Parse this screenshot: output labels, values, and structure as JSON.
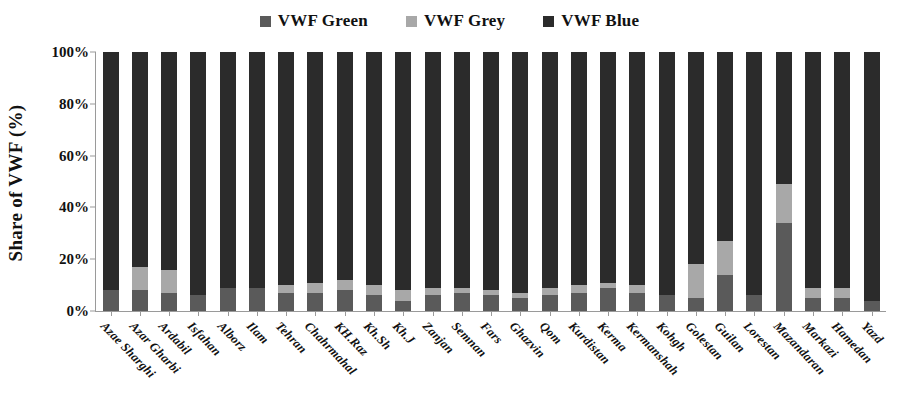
{
  "chart_data": {
    "type": "bar",
    "stacked": true,
    "title": "",
    "subtitle": "",
    "xlabel": "",
    "ylabel": "Share of VWF (%)",
    "ylim": [
      0,
      100
    ],
    "ytick_labels": [
      "0%",
      "20%",
      "40%",
      "60%",
      "80%",
      "100%"
    ],
    "ytick_values": [
      0,
      20,
      40,
      60,
      80,
      100
    ],
    "grid": false,
    "legend_position": "top-center",
    "units": "%",
    "categories": [
      "Azae Sharghi",
      "Azar Gharbi",
      "Ardabil",
      "Isfahan",
      "Alborz",
      "Ilam",
      "Tehran",
      "Chahrmahal",
      "KH.Raz",
      "Kh.Sh",
      "Kh.J",
      "Zanjan",
      "Semnan",
      "Fars",
      "Ghazvin",
      "Qom",
      "Kurdistan",
      "Kerma",
      "Kermanshah",
      "Kohgh",
      "Golestan",
      "Guilan",
      "Lorestan",
      "Mazandaran",
      "Markazi",
      "Hamedan",
      "Yazd"
    ],
    "series": [
      {
        "name": "VWF Green",
        "color": "#5a5a5a",
        "values": [
          8,
          8,
          7,
          6,
          9,
          9,
          7,
          7,
          8,
          6,
          4,
          6,
          7,
          6,
          5,
          6,
          7,
          9,
          7,
          6,
          5,
          14,
          6,
          34,
          5,
          5,
          4
        ]
      },
      {
        "name": "VWF Grey",
        "color": "#a8a8a8",
        "values": [
          0,
          9,
          9,
          0,
          0,
          0,
          3,
          4,
          4,
          4,
          4,
          3,
          2,
          2,
          2,
          3,
          3,
          2,
          3,
          0,
          13,
          13,
          0,
          15,
          4,
          4,
          0
        ]
      },
      {
        "name": "VWF Blue",
        "color": "#2b2b2b",
        "values": [
          92,
          83,
          84,
          94,
          91,
          91,
          90,
          89,
          88,
          90,
          92,
          91,
          91,
          92,
          93,
          91,
          90,
          89,
          90,
          94,
          82,
          73,
          94,
          51,
          91,
          91,
          96
        ]
      }
    ]
  },
  "legend": {
    "entries": [
      {
        "label": "VWF Green",
        "color": "#5a5a5a"
      },
      {
        "label": "VWF Grey",
        "color": "#a8a8a8"
      },
      {
        "label": "VWF Blue",
        "color": "#2b2b2b"
      }
    ]
  },
  "axes": {
    "y_title": "Share of VWF (%)"
  }
}
